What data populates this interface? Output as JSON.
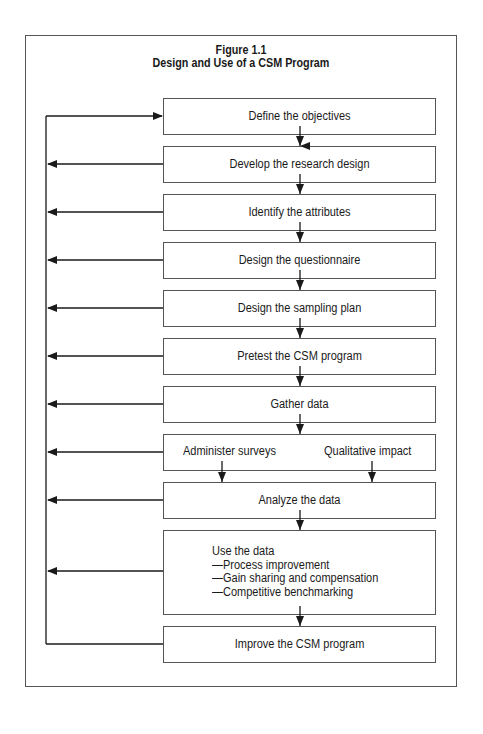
{
  "figure": {
    "title_line1": "Figure 1.1",
    "title_line2": "Design and Use of a CSM Program"
  },
  "steps": [
    {
      "label": "Define the objectives"
    },
    {
      "label": "Develop the research design"
    },
    {
      "label": "Identify the attributes"
    },
    {
      "label": "Design the questionnaire"
    },
    {
      "label": "Design the sampling plan"
    },
    {
      "label": "Pretest the CSM program"
    },
    {
      "label": "Gather data"
    },
    {
      "left_label": "Administer surveys",
      "right_label": "Qualitative impact"
    },
    {
      "label": "Analyze the data"
    },
    {
      "lines": [
        "Use the data",
        "—Process improvement",
        "—Gain sharing and compensation",
        "—Competitive benchmarking"
      ]
    },
    {
      "label": "Improve the CSM program"
    }
  ],
  "colors": {
    "line": "#1a1a1a",
    "frame": "#555555",
    "background": "#ffffff"
  }
}
